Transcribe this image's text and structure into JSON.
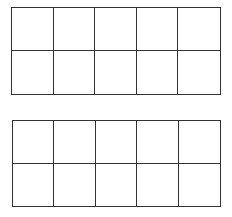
{
  "ten_frames": [
    {
      "name": "ten-frame-top",
      "rows": 2,
      "columns": 5,
      "filled_cells": 0
    },
    {
      "name": "ten-frame-bottom",
      "rows": 2,
      "columns": 5,
      "filled_cells": 0
    }
  ]
}
